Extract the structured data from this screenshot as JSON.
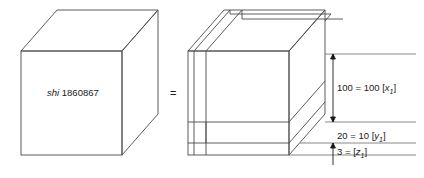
{
  "figure": {
    "stroke_color": "#4a4a4a",
    "text_color": "#1a1a1a",
    "background": "#ffffff"
  },
  "left_cube": {
    "label_italic": "shi",
    "label_value": "1860867"
  },
  "relation": {
    "equals": "="
  },
  "right_cube": {
    "dimensions": [
      {
        "id": "x",
        "value": "100",
        "equals": "=",
        "expression": "100",
        "bracket_open": "[",
        "symbol": "x",
        "subscript": "1",
        "bracket_close": "]"
      },
      {
        "id": "y",
        "value": "20",
        "equals": "=",
        "expression": "10",
        "bracket_open": "[",
        "symbol": "y",
        "subscript": "1",
        "bracket_close": "]"
      },
      {
        "id": "z",
        "value": "3",
        "equals": "=",
        "expression": "",
        "bracket_open": "[",
        "symbol": "z",
        "subscript": "1",
        "bracket_close": "]"
      }
    ]
  }
}
